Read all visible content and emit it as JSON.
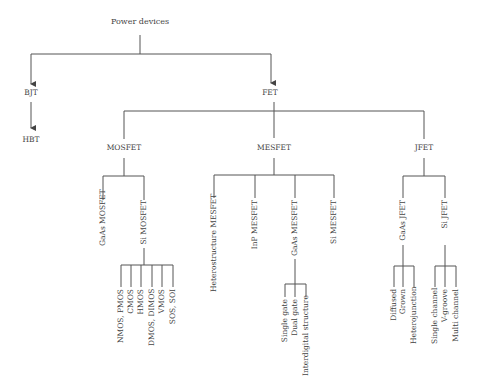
{
  "diagram": {
    "title": "Power devices",
    "level1": [
      {
        "label": "BJT",
        "children": [
          {
            "label": "HBT"
          }
        ]
      },
      {
        "label": "FET",
        "children": [
          {
            "label": "MOSFET",
            "children": [
              {
                "label": "GaAs MOSFET"
              },
              {
                "label": "Si MOSFET",
                "children": [
                  {
                    "label": "NMOS, PMOS"
                  },
                  {
                    "label": "CMOS"
                  },
                  {
                    "label": "HMOS"
                  },
                  {
                    "label": "DMOS, DIMOS"
                  },
                  {
                    "label": "VMOS"
                  },
                  {
                    "label": "SOS, SOI"
                  }
                ]
              }
            ]
          },
          {
            "label": "MESFET",
            "children": [
              {
                "label": "Heterostructure MESFET"
              },
              {
                "label": "InP MESFET"
              },
              {
                "label": "GaAs MESFET",
                "children": [
                  {
                    "label": "Single gate"
                  },
                  {
                    "label": "Dual gate"
                  },
                  {
                    "label": "Interdigital structure"
                  }
                ]
              },
              {
                "label": "Si MESFET"
              }
            ]
          },
          {
            "label": "JFET",
            "children": [
              {
                "label": "GaAs JFET",
                "children": [
                  {
                    "label": "Diffused"
                  },
                  {
                    "label": "Grown"
                  },
                  {
                    "label": "Heterojunction"
                  }
                ]
              },
              {
                "label": "Si JFET",
                "children": [
                  {
                    "label": "Single channel"
                  },
                  {
                    "label": "V-groove"
                  },
                  {
                    "label": "Multi channel"
                  }
                ]
              }
            ]
          }
        ]
      }
    ]
  },
  "colors": {
    "line": "#555555",
    "text": "#444444",
    "background": "#ffffff"
  }
}
